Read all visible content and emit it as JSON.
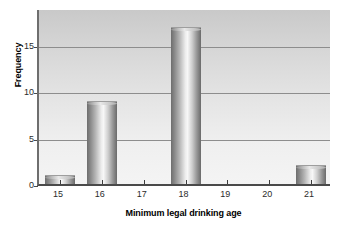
{
  "chart_data": {
    "type": "bar",
    "title": "",
    "xlabel": "Minimum legal drinking age",
    "ylabel": "Frequency",
    "categories": [
      "15",
      "16",
      "17",
      "18",
      "19",
      "20",
      "21"
    ],
    "values": [
      1,
      9,
      0,
      17,
      0,
      0,
      2
    ],
    "series": [
      {
        "name": "Frequency",
        "values": [
          1,
          9,
          0,
          17,
          0,
          0,
          2
        ]
      }
    ],
    "xlim": [
      14.5,
      21.5
    ],
    "ylim": [
      0,
      19
    ],
    "ytick_labels": [
      "0",
      "5",
      "10",
      "15"
    ],
    "ytick_values": [
      0,
      5,
      10,
      15
    ],
    "xtick_labels": [
      "15",
      "16",
      "17",
      "18",
      "19",
      "20",
      "21"
    ],
    "xtick_values": [
      15,
      16,
      17,
      18,
      19,
      20,
      21
    ],
    "grid": "horizontal",
    "legend": "none",
    "colors": {
      "bar_light": "#f7f7f7",
      "bar_dark": "#6a6a6a",
      "plot_background_top": "#c9c9c9",
      "plot_background_bottom": "#f4f4f4",
      "gridline": "#8d8d8d",
      "axis": "#4a4a4a",
      "text": "#000000"
    }
  }
}
